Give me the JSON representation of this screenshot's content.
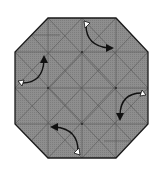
{
  "diagram": {
    "type": "origami-fold-diagram",
    "shape": "octagon",
    "colors": {
      "paper": "#8a8a8a",
      "outline": "#1a1a1a",
      "crease": "#5a5a5a",
      "arrow": "#111111",
      "arrow_tail": "#ffffff",
      "background": "#ffffff"
    },
    "octagon_vertices": [
      [
        48,
        18
      ],
      [
        116,
        18
      ],
      [
        148,
        52
      ],
      [
        148,
        124
      ],
      [
        116,
        158
      ],
      [
        48,
        158
      ],
      [
        15,
        124
      ],
      [
        15,
        52
      ]
    ],
    "fold_arrows": [
      {
        "id": "top",
        "from": [
          86,
          24
        ],
        "to": [
          112,
          48
        ],
        "direction": "clockwise"
      },
      {
        "id": "left",
        "from": [
          20,
          82
        ],
        "to": [
          44,
          57
        ],
        "direction": "clockwise"
      },
      {
        "id": "right",
        "from": [
          144,
          93
        ],
        "to": [
          119,
          119
        ],
        "direction": "clockwise"
      },
      {
        "id": "bottom",
        "from": [
          78,
          153
        ],
        "to": [
          51,
          127
        ],
        "direction": "clockwise"
      }
    ]
  }
}
